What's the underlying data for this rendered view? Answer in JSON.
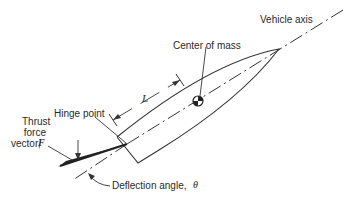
{
  "diagram": {
    "labels": {
      "vehicle_axis": "Vehicle axis",
      "center_of_mass": "Center of mass",
      "length": "L",
      "hinge_point": "Hinge point",
      "thrust_line1": "Thrust",
      "thrust_line2": "force",
      "thrust_line3": "vector,",
      "thrust_symbol": "F",
      "deflection": "Deflection angle,",
      "deflection_symbol": "θ"
    },
    "colors": {
      "line": "#333333",
      "background": "#ffffff"
    }
  }
}
